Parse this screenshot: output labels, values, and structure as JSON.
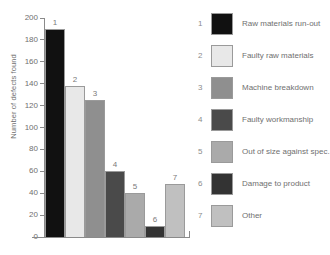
{
  "chart_data": {
    "type": "bar",
    "title": "",
    "xlabel": "",
    "ylabel": "Number of defects found",
    "ylim": [
      0,
      200
    ],
    "ytick_step": 20,
    "yticks": [
      0,
      20,
      40,
      60,
      80,
      100,
      120,
      140,
      160,
      180,
      200
    ],
    "grid": false,
    "legend_position": "right",
    "categories": [
      "1",
      "2",
      "3",
      "4",
      "5",
      "6",
      "7"
    ],
    "point_labels": [
      "1",
      "2",
      "3",
      "4",
      "5",
      "6",
      "7"
    ],
    "values": [
      190,
      138,
      125,
      60,
      40,
      10,
      48
    ],
    "series": [
      {
        "name": "Defect causes",
        "values": [
          190,
          138,
          125,
          60,
          40,
          10,
          48
        ]
      }
    ],
    "bar_colors": [
      "#111111",
      "#e8e8e8",
      "#8f8f8f",
      "#4a4a4a",
      "#aaaaaa",
      "#333333",
      "#c0c0c0"
    ],
    "legend": [
      {
        "key": "1",
        "label": "Raw materials run-out",
        "color": "#111111"
      },
      {
        "key": "2",
        "label": "Faulty raw materials",
        "color": "#e8e8e8"
      },
      {
        "key": "3",
        "label": "Machine breakdown",
        "color": "#8f8f8f"
      },
      {
        "key": "4",
        "label": "Faulty workmanship",
        "color": "#4a4a4a"
      },
      {
        "key": "5",
        "label": "Out of size against spec.",
        "color": "#aaaaaa"
      },
      {
        "key": "6",
        "label": "Damage to product",
        "color": "#333333"
      },
      {
        "key": "7",
        "label": "Other",
        "color": "#c0c0c0"
      }
    ]
  }
}
